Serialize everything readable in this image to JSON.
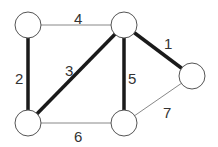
{
  "graph": {
    "nodes": [
      {
        "id": "A",
        "label": ""
      },
      {
        "id": "B",
        "label": ""
      },
      {
        "id": "C",
        "label": ""
      },
      {
        "id": "D",
        "label": ""
      },
      {
        "id": "E",
        "label": ""
      }
    ],
    "edges": [
      {
        "from": "B",
        "to": "C",
        "weight": "1",
        "highlighted": true
      },
      {
        "from": "A",
        "to": "D",
        "weight": "2",
        "highlighted": true
      },
      {
        "from": "B",
        "to": "D",
        "weight": "3",
        "highlighted": true
      },
      {
        "from": "A",
        "to": "B",
        "weight": "4",
        "highlighted": false
      },
      {
        "from": "B",
        "to": "E",
        "weight": "5",
        "highlighted": true
      },
      {
        "from": "D",
        "to": "E",
        "weight": "6",
        "highlighted": false
      },
      {
        "from": "E",
        "to": "C",
        "weight": "7",
        "highlighted": false
      }
    ],
    "colors": {
      "highlighted_edge": "#1a1a1a",
      "normal_edge": "#888888",
      "label": "#333333"
    }
  }
}
